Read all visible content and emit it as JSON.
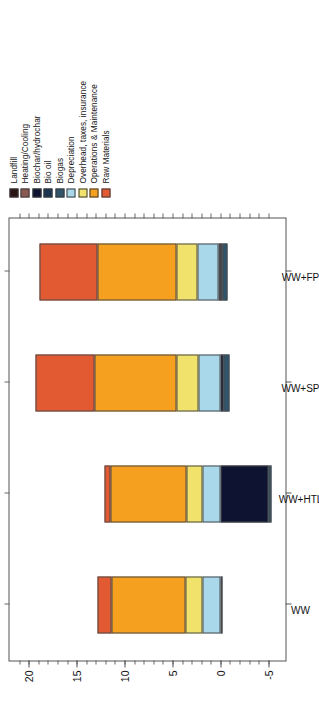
{
  "chart_data": {
    "type": "bar",
    "subtype": "stacked-bar",
    "title": "",
    "xlabel": "",
    "ylabel": "Operating Costs ($MM)",
    "ylim": [
      -7,
      22
    ],
    "yticks": [
      -5,
      0,
      5,
      10,
      15,
      20
    ],
    "ytick_labels": [
      "-5",
      "0",
      "5",
      "10",
      "15",
      "20"
    ],
    "grid": false,
    "legend_position": "top-right",
    "orientation": "vertical-bars-rotated-90ccw",
    "categories": [
      "WW",
      "WW+HTL",
      "WW+SP",
      "WW+FP"
    ],
    "series": [
      {
        "name": "Landfill",
        "color": "#2a1412",
        "values": [
          0.0,
          0.0,
          0.0,
          0.15
        ]
      },
      {
        "name": "Heating/Cooling",
        "color": "#8a5a52",
        "values": [
          0.0,
          0.0,
          0.0,
          0.0
        ]
      },
      {
        "name": "Biochar/hydrochar",
        "color": "#0d1330",
        "values": [
          0.0,
          -5.0,
          -0.35,
          -0.25
        ]
      },
      {
        "name": "Bio oil",
        "color": "#1b3550",
        "values": [
          0.0,
          0.0,
          0.0,
          0.0
        ]
      },
      {
        "name": "Biogas",
        "color": "#2f556b",
        "values": [
          -0.15,
          -0.3,
          -0.55,
          -0.5
        ]
      },
      {
        "name": "Depreciation",
        "color": "#a8d8ea",
        "values": [
          1.9,
          1.9,
          2.3,
          2.2
        ]
      },
      {
        "name": "Overhead, taxes, insurance",
        "color": "#f0e26a",
        "values": [
          1.7,
          1.6,
          2.3,
          2.2
        ]
      },
      {
        "name": "Operations & Maintenance",
        "color": "#f5a01e",
        "values": [
          7.8,
          8.0,
          8.5,
          8.3
        ]
      },
      {
        "name": "Raw Materials",
        "color": "#e25a32",
        "values": [
          1.4,
          0.6,
          6.2,
          6.0
        ]
      }
    ],
    "totals": [
      12.8,
      12.1,
      19.5,
      18.9
    ]
  },
  "legend": {
    "items": [
      {
        "label": "Landfill"
      },
      {
        "label": "Heating/Cooling"
      },
      {
        "label": "Biochar/hydrochar"
      },
      {
        "label": "Bio oil"
      },
      {
        "label": "Biogas"
      },
      {
        "label": "Depreciation"
      },
      {
        "label": "Overhead, taxes, insurance"
      },
      {
        "label": "Operations & Maintenance"
      },
      {
        "label": "Raw Materials"
      }
    ]
  }
}
